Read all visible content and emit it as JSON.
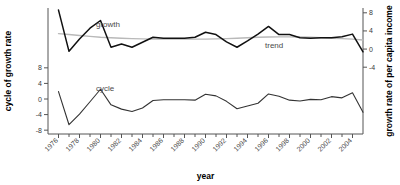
{
  "chart_data": {
    "type": "line",
    "title": "",
    "xlabel": "year",
    "ylabel_left": "cycle of growth rate",
    "ylabel_right": "growth rate of per capita income",
    "grid": false,
    "legend": "inline-labels",
    "xlim": [
      1975,
      2005
    ],
    "x_tick_step": 1,
    "x_labeled_step": 2,
    "xticks": [
      1976,
      1978,
      1980,
      1982,
      1984,
      1986,
      1988,
      1990,
      1992,
      1994,
      1996,
      1998,
      2000,
      2002,
      2004
    ],
    "xticklabels": [
      "1976",
      "1978",
      "1980",
      "1982",
      "1984",
      "1986",
      "1988",
      "1990",
      "1992",
      "1994",
      "1996",
      "1998",
      "2000",
      "2002",
      "2004"
    ],
    "left_axis": {
      "label": "cycle of growth rate",
      "ticks": [
        8,
        4,
        0,
        -4,
        -8
      ],
      "ticklabels": [
        "8",
        "4",
        "0",
        "-4",
        "-8"
      ],
      "ylim": [
        -9.5,
        9.5
      ]
    },
    "right_axis": {
      "label": "growth rate of per capita income",
      "ticks": [
        8,
        4,
        0,
        -4
      ],
      "ticklabels": [
        "8",
        "4",
        "0",
        "-4"
      ],
      "ylim": [
        -5.5,
        9.5
      ]
    },
    "x": [
      1976,
      1977,
      1978,
      1979,
      1980,
      1981,
      1982,
      1983,
      1984,
      1985,
      1986,
      1987,
      1988,
      1989,
      1990,
      1991,
      1992,
      1993,
      1994,
      1995,
      1996,
      1997,
      1998,
      1999,
      2000,
      2001,
      2002,
      2003,
      2004,
      2005
    ],
    "series": [
      {
        "name": "growth",
        "axis": "right",
        "color": "#111111",
        "label_text": "growth",
        "values": [
          8.6,
          -0.5,
          2.2,
          4.6,
          6.3,
          0.4,
          1.1,
          0.4,
          1.5,
          2.6,
          2.4,
          2.4,
          2.4,
          2.6,
          3.7,
          3.2,
          1.6,
          0.4,
          1.8,
          3.3,
          5.0,
          3.2,
          3.2,
          2.5,
          2.4,
          2.5,
          2.5,
          2.7,
          3.3,
          -0.6
        ]
      },
      {
        "name": "trend",
        "axis": "right",
        "color": "#b9b9b9",
        "label_text": "trend",
        "values": [
          3.4,
          3.2,
          3.0,
          2.8,
          2.6,
          2.5,
          2.4,
          2.3,
          2.25,
          2.2,
          2.2,
          2.2,
          2.2,
          2.2,
          2.2,
          2.25,
          2.3,
          2.4,
          2.5,
          2.6,
          2.65,
          2.7,
          2.7,
          2.65,
          2.6,
          2.5,
          2.4,
          2.3,
          2.2,
          2.0
        ]
      },
      {
        "name": "cycle",
        "axis": "left",
        "color": "#333333",
        "label_text": "cycle",
        "values": [
          1.9,
          -6.6,
          -3.9,
          -0.7,
          2.5,
          -1.5,
          -2.6,
          -3.2,
          -2.3,
          -0.4,
          -0.2,
          -0.2,
          -0.2,
          -0.3,
          1.2,
          0.8,
          -0.6,
          -2.5,
          -1.8,
          -1.1,
          1.3,
          0.7,
          -0.3,
          -0.5,
          -0.1,
          -0.2,
          0.6,
          0.3,
          1.6,
          -3.4
        ]
      }
    ],
    "annotations": [
      {
        "text": "growth",
        "x_px": 96,
        "y_px": 27
      },
      {
        "text": "trend",
        "x_px": 265,
        "y_px": 48
      },
      {
        "text": "cycle",
        "x_px": 96,
        "y_px": 91
      }
    ]
  }
}
